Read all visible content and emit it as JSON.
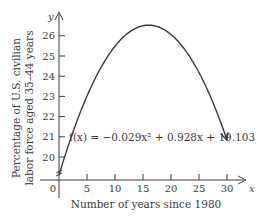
{
  "chart_data": {
    "type": "line",
    "title": "",
    "xlabel": "Number of years since 1980",
    "ylabel_lines": [
      "Percentage of U.S. civilian",
      "labor force aged 35–44 years"
    ],
    "x_axis_symbol": "x",
    "y_axis_symbol": "y",
    "xlim": [
      0,
      31
    ],
    "ylim": [
      19,
      26.7
    ],
    "x_ticks": [
      0,
      5,
      10,
      15,
      20,
      25,
      30
    ],
    "x_tick_labels": [
      "0",
      "5",
      "10",
      "15",
      "20",
      "25",
      "30"
    ],
    "y_ticks": [
      20,
      21,
      22,
      23,
      24,
      25,
      26
    ],
    "y_tick_labels": [
      "20",
      "21",
      "22",
      "23",
      "24",
      "25",
      "26"
    ],
    "y_axis_break": true,
    "grid": false,
    "function": {
      "label": "f(x) = −0.029x² + 0.928x + 19.103",
      "a": -0.029,
      "b": 0.928,
      "c": 19.103,
      "domain": [
        0,
        30
      ]
    },
    "series": [
      {
        "name": "f(x)",
        "x": [
          0,
          5,
          10,
          15,
          16,
          20,
          25,
          30
        ],
        "y": [
          19.103,
          23.018,
          25.483,
          26.498,
          26.527,
          26.063,
          24.178,
          21.043
        ]
      }
    ]
  }
}
